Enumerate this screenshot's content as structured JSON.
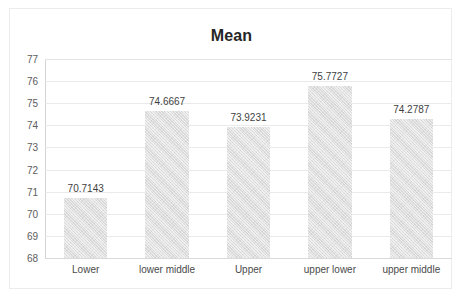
{
  "chart_data": {
    "type": "bar",
    "title": "Mean",
    "xlabel": "",
    "ylabel": "",
    "categories": [
      "Lower",
      "lower middle",
      "Upper",
      "upper lower",
      "upper middle"
    ],
    "values": [
      70.7143,
      74.6667,
      73.9231,
      75.7727,
      74.2787
    ],
    "data_labels": [
      "70.7143",
      "74.6667",
      "73.9231",
      "75.7727",
      "74.2787"
    ],
    "ylim": [
      68,
      77
    ],
    "ytick_labels": [
      "77",
      "76",
      "75",
      "74",
      "73",
      "72",
      "71",
      "70",
      "69",
      "68"
    ],
    "ytick_values": [
      77,
      76,
      75,
      74,
      73,
      72,
      71,
      70,
      69,
      68
    ],
    "grid": true,
    "legend": false,
    "legend_position": "none",
    "bar_color": "#dddddd",
    "title_color": "#262626",
    "gridline_color": "#eaeaea",
    "axis_label_color": "#5d5d5d",
    "background_color": "#ffffff",
    "border_color": "#ececed"
  }
}
